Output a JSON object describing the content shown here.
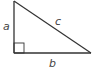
{
  "diagram": {
    "type": "right-triangle",
    "labels": {
      "vertical_leg": "a",
      "horizontal_leg": "b",
      "hypotenuse": "c"
    },
    "right_angle_marker": true,
    "colors": {
      "stroke": "#333333",
      "label": "#444444",
      "background": "#ffffff"
    }
  }
}
